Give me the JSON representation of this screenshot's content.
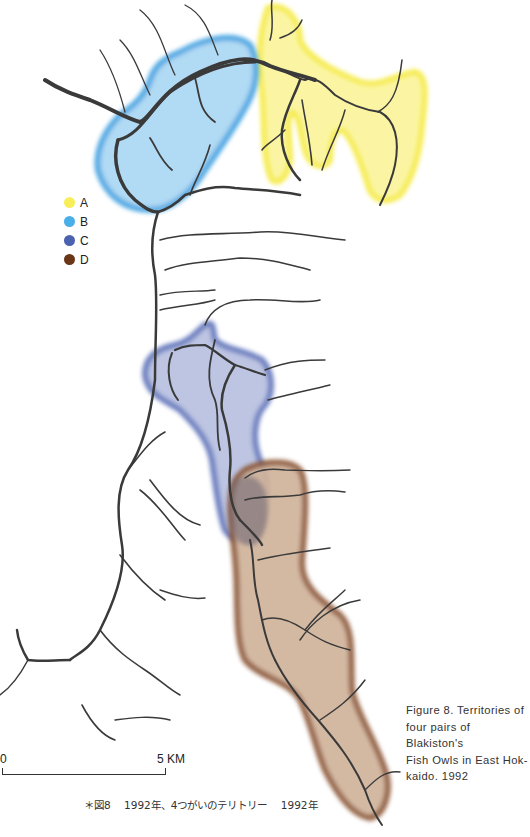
{
  "figure": {
    "legend": [
      {
        "label": "A",
        "color": "#f7ee5a"
      },
      {
        "label": "B",
        "color": "#4aaee8"
      },
      {
        "label": "C",
        "color": "#4a62b0"
      },
      {
        "label": "D",
        "color": "#6b3518"
      }
    ],
    "caption_en": "Figure 8. Territories of four pairs of Blakiston's Fish Owls in East Hokkaido. 1992",
    "caption_en_lines": [
      "Figure 8. Territories of",
      "four pairs of Blakiston's",
      "Fish Owls in East Hok-",
      "kaido. 1992"
    ],
    "scale_bar": {
      "start_label": "0",
      "end_label": "5 KM"
    },
    "caption_jp": {
      "marker": "＊図8",
      "text": "1992年、4つがいのテリトリー",
      "year": "1992年"
    }
  },
  "territories": {
    "A": {
      "fill": "#fbf59a",
      "edge": "#f5ea3c"
    },
    "B": {
      "fill": "#a9d6f3",
      "edge": "#3b9fe0"
    },
    "C": {
      "fill": "#b6bfe0",
      "edge": "#5a6fb8"
    },
    "D": {
      "fill": "#d1b49b",
      "edge": "#8a5230"
    }
  },
  "river_color": "#3a3a3a"
}
